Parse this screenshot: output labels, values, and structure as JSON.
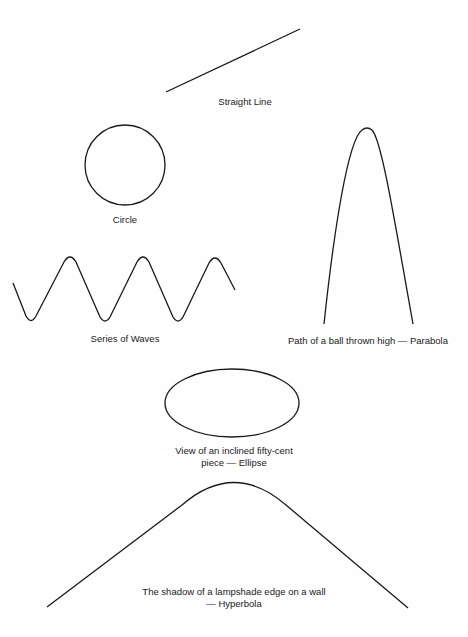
{
  "figures": {
    "line": {
      "label": "Straight Line"
    },
    "circle": {
      "label": "Circle"
    },
    "waves": {
      "label": "Series of Waves"
    },
    "parabola": {
      "label": "Path of a ball thrown high — Parabola"
    },
    "ellipse": {
      "label_line1": "View of an inclined fifty-cent",
      "label_line2": "piece — Ellipse"
    },
    "hyperbola": {
      "label_line1": "The shadow of a lampshade edge on a wall",
      "label_line2": "— Hyperbola"
    }
  },
  "colors": {
    "stroke": "#1a1a1a",
    "background": "#fefefe"
  }
}
